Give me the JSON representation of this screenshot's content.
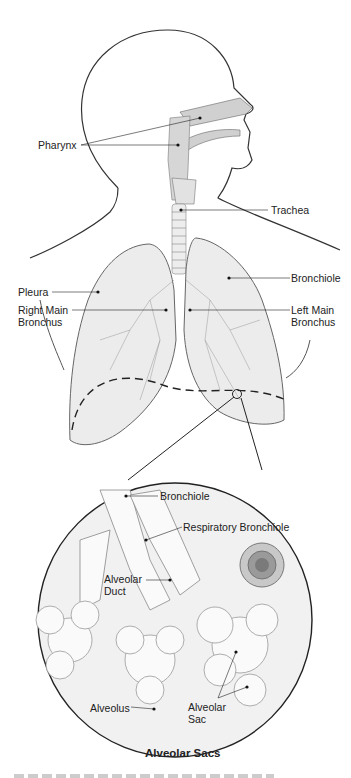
{
  "figure": {
    "caption": "Alveolar Sacs"
  },
  "upper_labels": {
    "pharynx": "Pharynx",
    "trachea": "Trachea",
    "bronchiole": "Bronchiole",
    "pleura": "Pleura",
    "right_main_bronchus_1": "Right Main",
    "right_main_bronchus_2": "Bronchus",
    "left_main_bronchus_1": "Left Main",
    "left_main_bronchus_2": "Bronchus"
  },
  "inset_labels": {
    "bronchiole": "Bronchiole",
    "respiratory_bronchiole": "Respiratory Bronchiole",
    "alveolar_duct_1": "Alveolar",
    "alveolar_duct_2": "Duct",
    "alveolus": "Alveolus",
    "alveolar_sac_1": "Alveolar",
    "alveolar_sac_2": "Sac"
  },
  "colors": {
    "line": "#333333",
    "fill_gray": "#d4d4d4",
    "lung_fill": "#ececec",
    "inset_bg": "#f1f1f1"
  }
}
